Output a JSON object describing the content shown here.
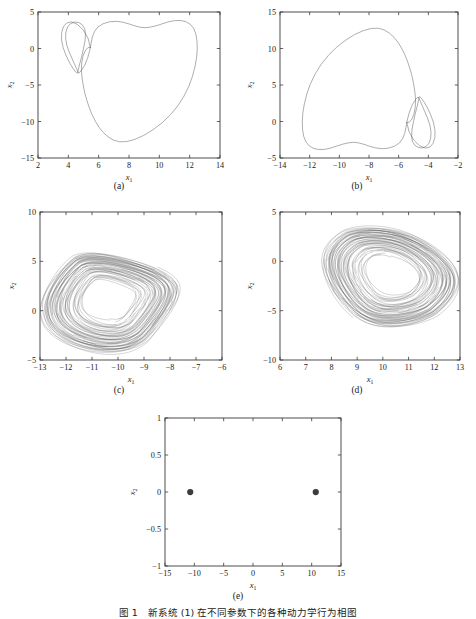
{
  "figure": {
    "caption": "图 1　新系统 (1) 在不同参数下的各种动力学行为相图",
    "background_color": "#ffffff",
    "line_color": "#4a4a4a",
    "axis_color": "#3a3a3a"
  },
  "panels": [
    {
      "tag": "(a)",
      "xlabel": "x",
      "xlabel_sub": "1",
      "ylabel": "x",
      "ylabel_sub": "2",
      "xlim": [
        2,
        14
      ],
      "ylim": [
        -15,
        5
      ],
      "xticks": [
        2,
        4,
        6,
        8,
        10,
        12,
        14
      ],
      "yticks": [
        -15,
        -10,
        -5,
        0,
        5
      ],
      "xticklabels": [
        "2",
        "4",
        "6",
        "8",
        "10",
        "12",
        "14"
      ],
      "yticklabels": [
        "-15",
        "-10",
        "-5",
        "0",
        "5"
      ],
      "type": "line"
    },
    {
      "tag": "(b)",
      "xlabel": "x",
      "xlabel_sub": "1",
      "ylabel": "x",
      "ylabel_sub": "2",
      "xlim": [
        -14,
        -2
      ],
      "ylim": [
        -5,
        15
      ],
      "xticks": [
        -14,
        -12,
        -10,
        -8,
        -6,
        -4,
        -2
      ],
      "yticks": [
        -5,
        0,
        5,
        10,
        15
      ],
      "xticklabels": [
        "-14",
        "-12",
        "-10",
        "-8",
        "-6",
        "-4",
        "-2"
      ],
      "yticklabels": [
        "-5",
        "0",
        "5",
        "10",
        "15"
      ],
      "type": "line"
    },
    {
      "tag": "(c)",
      "xlabel": "x",
      "xlabel_sub": "1",
      "ylabel": "x",
      "ylabel_sub": "2",
      "xlim": [
        -13,
        -6
      ],
      "ylim": [
        -5,
        10
      ],
      "xticks": [
        -13,
        -12,
        -11,
        -10,
        -9,
        -8,
        -7,
        -6
      ],
      "yticks": [
        -5,
        0,
        5,
        10
      ],
      "xticklabels": [
        "-13",
        "-12",
        "-11",
        "-10",
        "-9",
        "-8",
        "-7",
        "-6"
      ],
      "yticklabels": [
        "-5",
        "0",
        "5",
        "10"
      ],
      "type": "line"
    },
    {
      "tag": "(d)",
      "xlabel": "x",
      "xlabel_sub": "1",
      "ylabel": "x",
      "ylabel_sub": "2",
      "xlim": [
        6,
        13
      ],
      "ylim": [
        -10,
        5
      ],
      "xticks": [
        6,
        7,
        8,
        9,
        10,
        11,
        12,
        13
      ],
      "yticks": [
        -10,
        -5,
        0,
        5
      ],
      "xticklabels": [
        "6",
        "7",
        "8",
        "9",
        "10",
        "11",
        "12",
        "13"
      ],
      "yticklabels": [
        "-10",
        "-5",
        "0",
        "5"
      ],
      "type": "line"
    },
    {
      "tag": "(e)",
      "xlabel": "x",
      "xlabel_sub": "1",
      "ylabel": "x",
      "ylabel_sub": "2",
      "xlim": [
        -15,
        15
      ],
      "ylim": [
        -1,
        1
      ],
      "xticks": [
        -15,
        -10,
        -5,
        0,
        5,
        10,
        15
      ],
      "yticks": [
        -1,
        -0.5,
        0,
        0.5,
        1
      ],
      "xticklabels": [
        "-15",
        "-10",
        "-5",
        "0",
        "5",
        "10",
        "15"
      ],
      "yticklabels": [
        "-1",
        "-0.5",
        "0",
        "0.5",
        "1"
      ],
      "type": "scatter"
    }
  ],
  "chart_data": [
    {
      "type": "line",
      "panel": "(a)",
      "title": "",
      "xlabel": "x1",
      "ylabel": "x2",
      "xlim": [
        2,
        14
      ],
      "ylim": [
        -15,
        5
      ],
      "grid": false,
      "legend": "none",
      "description": "Period-2 limit cycle: large heart-shaped outer loop with a small secondary loop near x1=4",
      "series": [
        {
          "name": "trajectory",
          "points": [
            [
              5.45,
              0.15
            ],
            [
              5.3,
              1.4
            ],
            [
              5.0,
              2.5
            ],
            [
              4.6,
              3.3
            ],
            [
              4.2,
              3.65
            ],
            [
              3.9,
              3.5
            ],
            [
              3.68,
              3.0
            ],
            [
              3.56,
              2.2
            ],
            [
              3.55,
              1.2
            ],
            [
              3.66,
              0.1
            ],
            [
              3.86,
              -1.0
            ],
            [
              4.08,
              -1.95
            ],
            [
              4.3,
              -2.7
            ],
            [
              4.48,
              -3.2
            ],
            [
              4.58,
              -3.42
            ],
            [
              4.62,
              -3.35
            ],
            [
              4.66,
              -2.9
            ],
            [
              4.75,
              -2.1
            ],
            [
              4.88,
              -1.1
            ],
            [
              5.0,
              0.0
            ],
            [
              5.1,
              1.05
            ],
            [
              5.13,
              1.95
            ],
            [
              5.08,
              2.7
            ],
            [
              4.92,
              3.25
            ],
            [
              4.68,
              3.56
            ],
            [
              4.4,
              3.62
            ],
            [
              4.14,
              3.4
            ],
            [
              3.95,
              2.95
            ],
            [
              3.84,
              2.25
            ],
            [
              3.82,
              1.4
            ],
            [
              3.9,
              0.45
            ],
            [
              4.06,
              -0.5
            ],
            [
              4.25,
              -1.4
            ],
            [
              4.42,
              -2.2
            ],
            [
              4.56,
              -2.85
            ],
            [
              4.64,
              -3.25
            ],
            [
              4.7,
              -3.35
            ],
            [
              4.85,
              -3.05
            ],
            [
              5.08,
              -2.3
            ],
            [
              5.28,
              -1.25
            ],
            [
              5.42,
              -0.2
            ],
            [
              5.5,
              0.7
            ],
            [
              5.58,
              1.55
            ],
            [
              5.72,
              2.3
            ],
            [
              5.95,
              2.95
            ],
            [
              6.3,
              3.4
            ],
            [
              6.72,
              3.66
            ],
            [
              7.15,
              3.72
            ],
            [
              7.55,
              3.62
            ],
            [
              7.95,
              3.4
            ],
            [
              8.35,
              3.12
            ],
            [
              8.72,
              2.92
            ],
            [
              9.05,
              2.85
            ],
            [
              9.4,
              2.93
            ],
            [
              9.8,
              3.12
            ],
            [
              10.22,
              3.4
            ],
            [
              10.62,
              3.66
            ],
            [
              11.0,
              3.82
            ],
            [
              11.38,
              3.84
            ],
            [
              11.72,
              3.7
            ],
            [
              12.02,
              3.35
            ],
            [
              12.25,
              2.8
            ],
            [
              12.4,
              2.05
            ],
            [
              12.48,
              1.1
            ],
            [
              12.5,
              0.0
            ],
            [
              12.46,
              -1.2
            ],
            [
              12.35,
              -2.5
            ],
            [
              12.18,
              -3.85
            ],
            [
              11.94,
              -5.2
            ],
            [
              11.62,
              -6.55
            ],
            [
              11.22,
              -7.85
            ],
            [
              10.74,
              -9.05
            ],
            [
              10.2,
              -10.15
            ],
            [
              9.6,
              -11.1
            ],
            [
              8.98,
              -11.9
            ],
            [
              8.38,
              -12.45
            ],
            [
              7.85,
              -12.75
            ],
            [
              7.38,
              -12.78
            ],
            [
              6.98,
              -12.55
            ],
            [
              6.62,
              -12.1
            ],
            [
              6.3,
              -11.5
            ],
            [
              6.02,
              -10.78
            ],
            [
              5.78,
              -9.95
            ],
            [
              5.56,
              -9.05
            ],
            [
              5.38,
              -8.1
            ],
            [
              5.22,
              -7.1
            ],
            [
              5.08,
              -6.05
            ],
            [
              4.98,
              -5.0
            ],
            [
              4.9,
              -3.95
            ],
            [
              4.86,
              -2.95
            ],
            [
              4.88,
              -2.0
            ],
            [
              4.96,
              -1.1
            ],
            [
              5.1,
              -0.35
            ],
            [
              5.28,
              0.1
            ],
            [
              5.45,
              0.15
            ]
          ]
        }
      ]
    },
    {
      "type": "line",
      "panel": "(b)",
      "title": "",
      "xlabel": "x1",
      "ylabel": "x2",
      "xlim": [
        -14,
        -2
      ],
      "ylim": [
        -5,
        15
      ],
      "grid": false,
      "legend": "none",
      "description": "Mirror-image period-2 limit cycle of panel (a), reflected through the origin",
      "mirror_of": "(a)",
      "series": [
        {
          "name": "trajectory",
          "points": [
            [
              -5.45,
              -0.15
            ],
            [
              -5.3,
              -1.4
            ],
            [
              -5.0,
              -2.5
            ],
            [
              -4.6,
              -3.3
            ],
            [
              -4.2,
              -3.65
            ],
            [
              -3.9,
              -3.5
            ],
            [
              -3.68,
              -3.0
            ],
            [
              -3.56,
              -2.2
            ],
            [
              -3.55,
              -1.2
            ],
            [
              -3.66,
              -0.1
            ],
            [
              -3.86,
              1.0
            ],
            [
              -4.08,
              1.95
            ],
            [
              -4.3,
              2.7
            ],
            [
              -4.48,
              3.2
            ],
            [
              -4.58,
              3.42
            ],
            [
              -4.62,
              3.35
            ],
            [
              -4.66,
              2.9
            ],
            [
              -4.75,
              2.1
            ],
            [
              -4.88,
              1.1
            ],
            [
              -5.0,
              0.0
            ],
            [
              -5.1,
              -1.05
            ],
            [
              -5.13,
              -1.95
            ],
            [
              -5.08,
              -2.7
            ],
            [
              -4.92,
              -3.25
            ],
            [
              -4.68,
              -3.56
            ],
            [
              -4.4,
              -3.62
            ],
            [
              -4.14,
              -3.4
            ],
            [
              -3.95,
              -2.95
            ],
            [
              -3.84,
              -2.25
            ],
            [
              -3.82,
              -1.4
            ],
            [
              -3.9,
              -0.45
            ],
            [
              -4.06,
              0.5
            ],
            [
              -4.25,
              1.4
            ],
            [
              -4.42,
              2.2
            ],
            [
              -4.56,
              2.85
            ],
            [
              -4.64,
              3.25
            ],
            [
              -4.7,
              3.35
            ],
            [
              -4.85,
              3.05
            ],
            [
              -5.08,
              2.3
            ],
            [
              -5.28,
              1.25
            ],
            [
              -5.42,
              0.2
            ],
            [
              -5.5,
              -0.7
            ],
            [
              -5.58,
              -1.55
            ],
            [
              -5.72,
              -2.3
            ],
            [
              -5.95,
              -2.95
            ],
            [
              -6.3,
              -3.4
            ],
            [
              -6.72,
              -3.66
            ],
            [
              -7.15,
              -3.72
            ],
            [
              -7.55,
              -3.62
            ],
            [
              -7.95,
              -3.4
            ],
            [
              -8.35,
              -3.12
            ],
            [
              -8.72,
              -2.92
            ],
            [
              -9.05,
              -2.85
            ],
            [
              -9.4,
              -2.93
            ],
            [
              -9.8,
              -3.12
            ],
            [
              -10.22,
              -3.4
            ],
            [
              -10.62,
              -3.66
            ],
            [
              -11.0,
              -3.82
            ],
            [
              -11.38,
              -3.84
            ],
            [
              -11.72,
              -3.7
            ],
            [
              -12.02,
              -3.35
            ],
            [
              -12.25,
              -2.8
            ],
            [
              -12.4,
              -2.05
            ],
            [
              -12.48,
              -1.1
            ],
            [
              -12.5,
              0.0
            ],
            [
              -12.46,
              1.2
            ],
            [
              -12.35,
              2.5
            ],
            [
              -12.18,
              3.85
            ],
            [
              -11.94,
              5.2
            ],
            [
              -11.62,
              6.55
            ],
            [
              -11.22,
              7.85
            ],
            [
              -10.74,
              9.05
            ],
            [
              -10.2,
              10.15
            ],
            [
              -9.6,
              11.1
            ],
            [
              -8.98,
              11.9
            ],
            [
              -8.38,
              12.45
            ],
            [
              -7.85,
              12.75
            ],
            [
              -7.38,
              12.78
            ],
            [
              -6.98,
              12.55
            ],
            [
              -6.62,
              12.1
            ],
            [
              -6.3,
              11.5
            ],
            [
              -6.02,
              10.78
            ],
            [
              -5.78,
              9.95
            ],
            [
              -5.56,
              9.05
            ],
            [
              -5.38,
              8.1
            ],
            [
              -5.22,
              7.1
            ],
            [
              -5.08,
              6.05
            ],
            [
              -4.98,
              5.0
            ],
            [
              -4.9,
              3.95
            ],
            [
              -4.86,
              2.95
            ],
            [
              -4.88,
              2.0
            ],
            [
              -4.96,
              1.1
            ],
            [
              -5.1,
              0.35
            ],
            [
              -5.28,
              -0.1
            ],
            [
              -5.45,
              -0.15
            ]
          ]
        }
      ]
    },
    {
      "type": "line",
      "panel": "(c)",
      "title": "",
      "xlabel": "x1",
      "ylabel": "x2",
      "xlim": [
        -13,
        -6
      ],
      "ylim": [
        -5,
        10
      ],
      "grid": false,
      "legend": "none",
      "description": "Single-scroll chaotic attractor; dense band of trajectories spiralling outward, centre hole near (-10.6, 0.5)",
      "attractor": {
        "center": [
          -10.3,
          1.2
        ],
        "inner_radius_x": 0.85,
        "inner_radius_y": 2.0,
        "outer_radius_x": 2.55,
        "outer_radius_y": 5.4,
        "turns": 46,
        "x_extent": [
          -12.35,
          -6.3
        ],
        "y_extent": [
          -4.5,
          9.5
        ]
      }
    },
    {
      "type": "line",
      "panel": "(d)",
      "title": "",
      "xlabel": "x1",
      "ylabel": "x2",
      "xlim": [
        6,
        13
      ],
      "ylim": [
        -10,
        5
      ],
      "grid": false,
      "legend": "none",
      "description": "Mirror-image single-scroll chaotic attractor of panel (c), reflected through the origin",
      "mirror_of": "(c)",
      "attractor": {
        "center": [
          10.3,
          -1.2
        ],
        "inner_radius_x": 0.85,
        "inner_radius_y": 2.0,
        "outer_radius_x": 2.55,
        "outer_radius_y": 5.4,
        "turns": 46,
        "x_extent": [
          6.3,
          12.35
        ],
        "y_extent": [
          -9.5,
          4.5
        ]
      }
    },
    {
      "type": "scatter",
      "panel": "(e)",
      "title": "",
      "xlabel": "x1",
      "ylabel": "x2",
      "xlim": [
        -15,
        15
      ],
      "ylim": [
        -1,
        1
      ],
      "grid": false,
      "legend": "none",
      "description": "Two symmetric equilibrium points of the system located on the x1 axis",
      "points": [
        {
          "x": -10.7,
          "y": 0
        },
        {
          "x": 10.7,
          "y": 0
        }
      ],
      "marker": "filled-circle",
      "marker_size": 5
    }
  ]
}
